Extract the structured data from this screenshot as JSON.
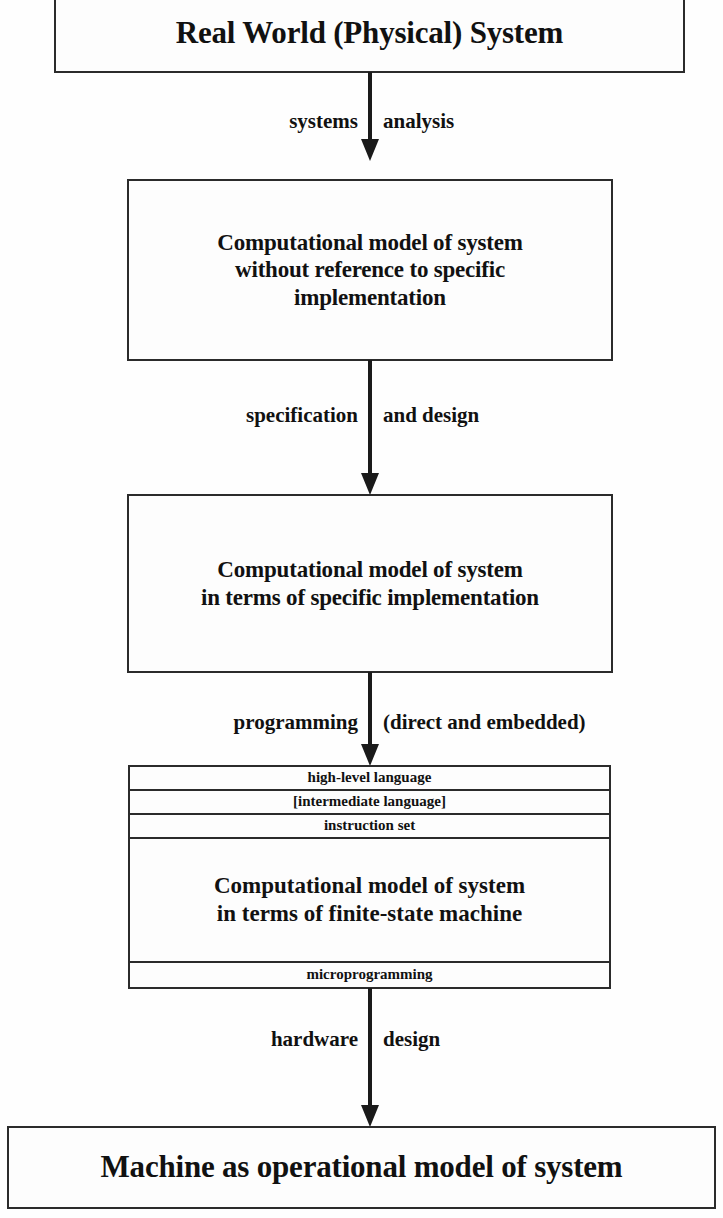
{
  "diagram": {
    "colors": {
      "background": "#fefefe",
      "box_fill": "#fdfdfd",
      "stroke": "#2b2b2b",
      "arrow": "#1a1a1a",
      "text": "#111111"
    },
    "nodes": {
      "real_world": {
        "label": "Real World (Physical) System"
      },
      "abstract_model": {
        "line1": "Computational model of system",
        "line2": "without reference to specific",
        "line3": "implementation"
      },
      "specific_model": {
        "line1": "Computational model of system",
        "line2": "in terms of specific implementation"
      },
      "fsm_stack": {
        "bands": [
          {
            "label": "high-level language",
            "kind": "thin"
          },
          {
            "label": "[intermediate language]",
            "kind": "thin"
          },
          {
            "label": "instruction set",
            "kind": "thin"
          },
          {
            "label": "Computational model of system\nin terms of finite-state machine",
            "kind": "main"
          },
          {
            "label": "microprogramming",
            "kind": "thin"
          }
        ],
        "main_line1": "Computational model of system",
        "main_line2": "in terms of finite-state machine",
        "band_high_level": "high-level language",
        "band_intermediate": "[intermediate language]",
        "band_instruction_set": "instruction set",
        "band_microprogramming": "microprogramming"
      },
      "machine": {
        "label": "Machine as operational model of system"
      }
    },
    "edges": [
      {
        "id": "edge-1",
        "left_label": "systems",
        "right_label": "analysis",
        "from": "real_world",
        "to": "abstract_model"
      },
      {
        "id": "edge-2",
        "left_label": "specification",
        "right_label": "and design",
        "from": "abstract_model",
        "to": "specific_model"
      },
      {
        "id": "edge-3",
        "left_label": "programming",
        "right_label": "(direct and embedded)",
        "from": "specific_model",
        "to": "fsm_stack"
      },
      {
        "id": "edge-4",
        "left_label": "hardware",
        "right_label": "design",
        "from": "fsm_stack",
        "to": "machine"
      }
    ]
  }
}
